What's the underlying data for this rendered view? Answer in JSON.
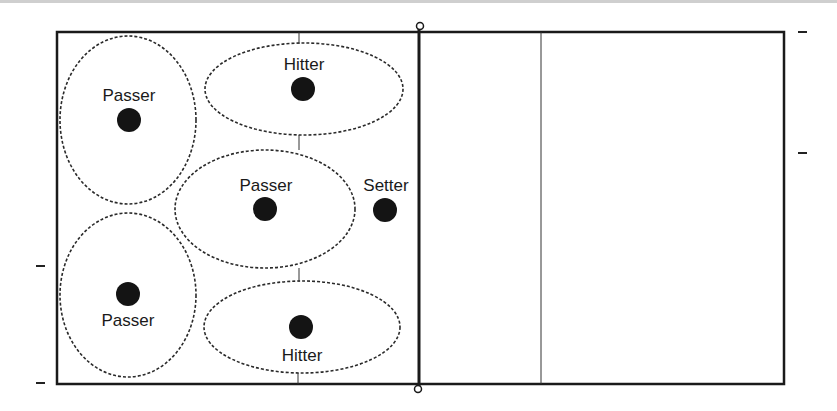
{
  "diagram": {
    "court": {
      "left": 57,
      "top": 32,
      "right": 784,
      "bottom": 384,
      "net_x": 419,
      "center_line_x": 299,
      "attack_line_x": 541
    },
    "colors": {
      "line": "#1a1a1a",
      "ellipse": "#2a2a2a",
      "player": "#141414",
      "background": "#ffffff"
    },
    "players": [
      {
        "role": "Passer",
        "label": "Passer",
        "x": 129,
        "y": 120,
        "label_pos": "above"
      },
      {
        "role": "Hitter",
        "label": "Hitter",
        "x": 303,
        "y": 89,
        "label_pos": "above"
      },
      {
        "role": "Passer",
        "label": "Passer",
        "x": 265,
        "y": 209,
        "label_pos": "above"
      },
      {
        "role": "Setter",
        "label": "Setter",
        "x": 385,
        "y": 210,
        "label_pos": "above"
      },
      {
        "role": "Passer",
        "label": "Passer",
        "x": 128,
        "y": 294,
        "label_pos": "below"
      },
      {
        "role": "Hitter",
        "label": "Hitter",
        "x": 301,
        "y": 327,
        "label_pos": "below"
      }
    ],
    "zones": [
      {
        "name": "passer-zone-left-top",
        "cx": 128,
        "cy": 120,
        "rx": 68,
        "ry": 84
      },
      {
        "name": "hitter-zone-top",
        "cx": 304,
        "cy": 89,
        "rx": 99,
        "ry": 46
      },
      {
        "name": "passer-zone-middle",
        "cx": 265,
        "cy": 209,
        "rx": 90,
        "ry": 59
      },
      {
        "name": "passer-zone-left-bottom",
        "cx": 128,
        "cy": 295,
        "rx": 68,
        "ry": 82
      },
      {
        "name": "hitter-zone-bottom",
        "cx": 302,
        "cy": 327,
        "rx": 98,
        "ry": 46
      }
    ],
    "labels": {
      "p1": "Passer",
      "h1": "Hitter",
      "p2": "Passer",
      "s1": "Setter",
      "p3": "Passer",
      "h2": "Hitter"
    }
  }
}
